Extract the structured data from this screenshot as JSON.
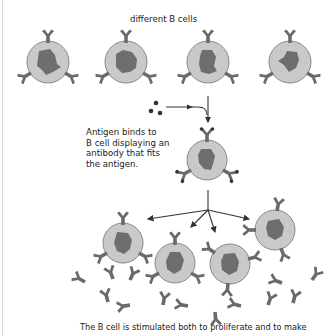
{
  "labels": {
    "top_caption": "different B cells",
    "binding_note_lines": [
      "Antigen binds to",
      "B cell displaying an",
      "antibody that fits",
      "the antigen."
    ],
    "bottom_caption": "The B cell is stimulated both to proliferate and to make"
  },
  "colors": {
    "cell_fill": "#c9c9c9",
    "cell_border": "#8a8a8a",
    "nucleus": "#6e6e6e",
    "antibody": "#6a6a6a",
    "antigen": "#333333",
    "arrow": "#333333"
  },
  "diagram": {
    "top_cells": [
      {
        "cx": 48,
        "cy": 62
      },
      {
        "cx": 126,
        "cy": 62
      },
      {
        "cx": 208,
        "cy": 62
      },
      {
        "cx": 290,
        "cy": 62
      }
    ],
    "selected_cell": {
      "cx": 207,
      "cy": 160
    },
    "clone_cells": [
      {
        "cx": 123,
        "cy": 243
      },
      {
        "cx": 175,
        "cy": 263
      },
      {
        "cx": 230,
        "cy": 264
      },
      {
        "cx": 275,
        "cy": 230
      }
    ],
    "free_antibodies": [
      [
        85,
        278
      ],
      [
        110,
        273
      ],
      [
        131,
        274
      ],
      [
        280,
        279
      ],
      [
        310,
        276
      ],
      [
        105,
        297
      ],
      [
        132,
        301
      ],
      [
        163,
        299
      ],
      [
        192,
        304
      ],
      [
        215,
        308
      ],
      [
        243,
        304
      ],
      [
        268,
        300
      ],
      [
        294,
        298
      ]
    ]
  }
}
